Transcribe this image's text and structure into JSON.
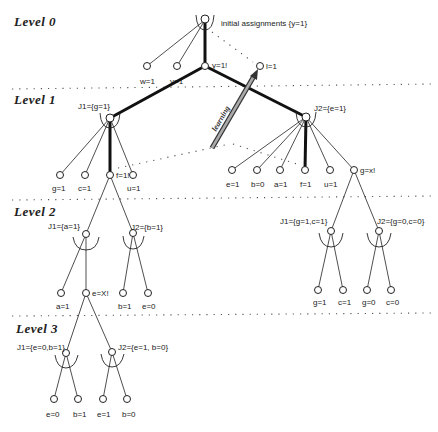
{
  "levels": [
    {
      "label": "Level 0"
    },
    {
      "label": "Level 1"
    },
    {
      "label": "Level 2"
    },
    {
      "label": "Level 3"
    }
  ],
  "annotations": {
    "root": "initial assignments {y=1}",
    "learning": "learning"
  },
  "level0": {
    "children": [
      "w=1",
      "v=1",
      "y=1!"
    ],
    "learned": "l=1"
  },
  "level1": {
    "j1": {
      "label": "J1={g=1}",
      "children": [
        "g=1",
        "c=1",
        "f=1!",
        "u=1"
      ]
    },
    "j2": {
      "label": "J2={e=1}",
      "children": [
        "e=1",
        "b=0",
        "a=1",
        "f=1",
        "u=1",
        "g=x!"
      ]
    }
  },
  "level2": {
    "left": {
      "j1": {
        "label": "J1={a=1}",
        "children": [
          "a=1",
          "e=X!"
        ]
      },
      "j2": {
        "label": "J2={b=1}",
        "children": [
          "b=1",
          "e=0"
        ]
      }
    },
    "right": {
      "j1": {
        "label": "J1={g=1,c=1}",
        "children": [
          "g=1",
          "c=1"
        ]
      },
      "j2": {
        "label": "J2={g=0,c=0}",
        "children": [
          "g=0",
          "c=0"
        ]
      }
    }
  },
  "level3": {
    "j1": {
      "label": "J1={e=0,b=1}",
      "children": [
        "e=0",
        "b=1"
      ]
    },
    "j2": {
      "label": "J2={e=1, b=0}",
      "children": [
        "e=1",
        "b=0"
      ]
    }
  }
}
